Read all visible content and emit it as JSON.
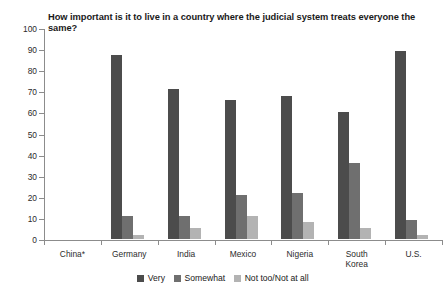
{
  "chart_data": {
    "type": "bar",
    "title": "How important is it to live in a country where the judicial system treats everyone the same?",
    "xlabel": "",
    "ylabel": "",
    "ylim": [
      0,
      100
    ],
    "ytick_labels": [
      "0",
      "10",
      "20",
      "30",
      "40",
      "50",
      "60",
      "70",
      "80",
      "90",
      "100"
    ],
    "ytick_values": [
      0,
      10,
      20,
      30,
      40,
      50,
      60,
      70,
      80,
      90,
      100
    ],
    "grid": false,
    "legend_position": "bottom-center",
    "categories": [
      "China*",
      "Germany",
      "India",
      "Mexico",
      "Nigeria",
      "South\nKorea",
      "U.S."
    ],
    "series": [
      {
        "name": "Very",
        "color": "#4c4c4c",
        "values": [
          null,
          87,
          71,
          66,
          68,
          60,
          89
        ]
      },
      {
        "name": "Somewhat",
        "color": "#6f6f6f",
        "values": [
          null,
          11,
          11,
          21,
          22,
          36,
          9
        ]
      },
      {
        "name": "Not too/Not at all",
        "color": "#b3b3b3",
        "values": [
          null,
          2,
          5,
          11,
          8,
          5,
          2
        ]
      }
    ]
  },
  "legend": {
    "items": [
      {
        "label": "Very",
        "swatch": "very"
      },
      {
        "label": "Somewhat",
        "swatch": "somewhat"
      },
      {
        "label": "Not too/Not at all",
        "swatch": "nottoo"
      }
    ]
  }
}
